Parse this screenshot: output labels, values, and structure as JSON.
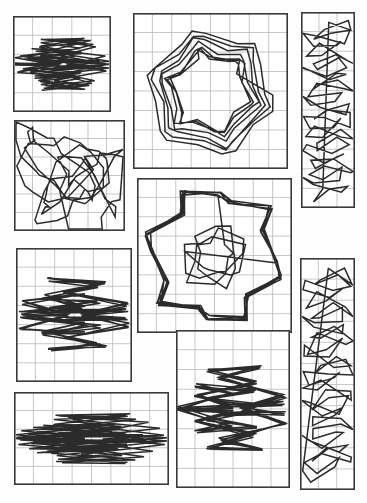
{
  "page": {
    "background_color": "#fefefe",
    "width": 367,
    "height": 503,
    "panel_count": 9
  },
  "style": {
    "frame_color": "#3a3a3a",
    "frame_width": 1.6,
    "grid_color": "#b9b9b9",
    "grid_width": 0.8,
    "stroke_color": "#2b2b2b",
    "stroke_width": 1.5
  },
  "chart_data": {
    "type": "line",
    "xlabel": "",
    "ylabel": "",
    "grid": true,
    "legend": "none",
    "panels": [
      {
        "name": "panel-top-left",
        "x": 13,
        "y": 16,
        "w": 98,
        "h": 96,
        "cols": 5,
        "rows": 5,
        "pattern": "double-star-pair",
        "seed": 3,
        "points": 96,
        "turns": 5,
        "amplitude": 0.42
      },
      {
        "name": "panel-top-center",
        "x": 133,
        "y": 13,
        "w": 155,
        "h": 156,
        "cols": 8,
        "rows": 8,
        "pattern": "nested-zigzag-frame",
        "seed": 7,
        "points": 120,
        "turns": 7,
        "amplitude": 0.46
      },
      {
        "name": "panel-top-right",
        "x": 301,
        "y": 12,
        "w": 54,
        "h": 196,
        "cols": 3,
        "rows": 10,
        "pattern": "vertical-chain",
        "seed": 11,
        "points": 88,
        "turns": 9,
        "amplitude": 0.4
      },
      {
        "name": "panel-mid-left",
        "x": 14,
        "y": 120,
        "w": 111,
        "h": 111,
        "cols": 6,
        "rows": 6,
        "pattern": "diagonal-sweep",
        "seed": 5,
        "points": 104,
        "turns": 6,
        "amplitude": 0.44
      },
      {
        "name": "panel-mid-center",
        "x": 137,
        "y": 178,
        "w": 155,
        "h": 155,
        "cols": 8,
        "rows": 8,
        "pattern": "ring-with-core",
        "seed": 13,
        "points": 128,
        "turns": 8,
        "amplitude": 0.47
      },
      {
        "name": "panel-mid-right",
        "x": 300,
        "y": 258,
        "w": 55,
        "h": 232,
        "cols": 3,
        "rows": 11,
        "pattern": "vertical-chain",
        "seed": 17,
        "points": 92,
        "turns": 10,
        "amplitude": 0.41
      },
      {
        "name": "panel-low-left",
        "x": 16,
        "y": 248,
        "w": 116,
        "h": 134,
        "cols": 6,
        "rows": 7,
        "pattern": "double-loop",
        "seed": 19,
        "points": 108,
        "turns": 6,
        "amplitude": 0.45
      },
      {
        "name": "panel-low-center",
        "x": 176,
        "y": 330,
        "w": 114,
        "h": 158,
        "cols": 6,
        "rows": 8,
        "pattern": "tall-knot",
        "seed": 23,
        "points": 112,
        "turns": 7,
        "amplitude": 0.45
      },
      {
        "name": "panel-bottom-left",
        "x": 14,
        "y": 392,
        "w": 155,
        "h": 93,
        "cols": 8,
        "rows": 5,
        "pattern": "wide-twin-loop",
        "seed": 29,
        "points": 110,
        "turns": 6,
        "amplitude": 0.43
      }
    ]
  }
}
